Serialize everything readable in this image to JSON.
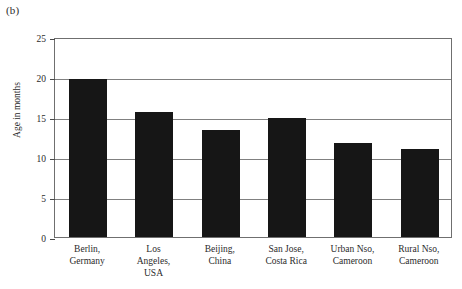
{
  "panel_label": "(b)",
  "chart_data": {
    "type": "bar",
    "title": "",
    "subtitle": "",
    "xlabel": "",
    "ylabel": "Age in months",
    "ylim": [
      0,
      25
    ],
    "yticks": [
      0,
      5,
      10,
      15,
      20,
      25
    ],
    "ytick_labels": [
      "0",
      "5",
      "10",
      "15",
      "20",
      "25"
    ],
    "grid": true,
    "legend": false,
    "bar_color": "#161616",
    "categories": [
      "Berlin, Germany",
      "Los Angeles, USA",
      "Beijing, China",
      "San Jose, Costa Rica",
      "Urban Nso, Cameroon",
      "Rural Nso, Cameroon"
    ],
    "category_lines": [
      [
        "Berlin,",
        "Germany"
      ],
      [
        "Los",
        "Angeles,",
        "USA"
      ],
      [
        "Beijing,",
        "China"
      ],
      [
        "San Jose,",
        "Costa Rica"
      ],
      [
        "Urban Nso,",
        "Cameroon"
      ],
      [
        "Rural Nso,",
        "Cameroon"
      ]
    ],
    "values": [
      19.8,
      15.6,
      13.4,
      14.9,
      11.8,
      11.0
    ]
  }
}
